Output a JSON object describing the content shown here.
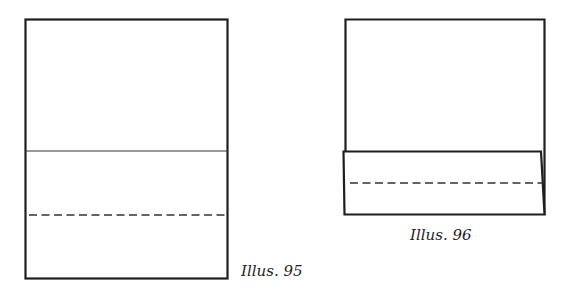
{
  "figures": [
    {
      "id": "illus-95",
      "caption": "Illus. 95",
      "description": "Rectangular sheet with a solid crease line and a dashed fold line below it"
    },
    {
      "id": "illus-96",
      "caption": "Illus. 96",
      "description": "Sheet with bottom portion folded up, showing dashed fold line on the flap"
    }
  ],
  "colors": {
    "stroke": "#1e1e1e",
    "background": "#ffffff"
  }
}
